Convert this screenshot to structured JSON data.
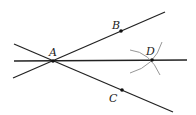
{
  "diagram": {
    "type": "geometric-construction",
    "points": [
      {
        "id": "A",
        "label": "A",
        "x": 53,
        "y": 61,
        "label_x": 49,
        "label_y": 56
      },
      {
        "id": "B",
        "label": "B",
        "x": 121,
        "y": 31,
        "label_x": 112,
        "label_y": 29
      },
      {
        "id": "C",
        "label": "C",
        "x": 122,
        "y": 90,
        "label_x": 109,
        "label_y": 102
      },
      {
        "id": "D",
        "label": "D",
        "x": 152,
        "y": 60,
        "label_x": 146,
        "label_y": 55
      }
    ],
    "lines": [
      {
        "name": "line-AB",
        "x1": 13,
        "y1": 78,
        "x2": 165,
        "y2": 12
      },
      {
        "name": "line-AC",
        "x1": 14,
        "y1": 44,
        "x2": 173,
        "y2": 112
      },
      {
        "name": "line-AD",
        "x1": 14,
        "y1": 61,
        "x2": 187,
        "y2": 60
      }
    ],
    "arcs": [
      {
        "name": "arc-from-B",
        "d": "M 130 50 Q 150 52 160 75"
      },
      {
        "name": "arc-from-C",
        "d": "M 162 42 Q 155 66 130 73"
      }
    ],
    "colors": {
      "line": "#222222",
      "arc": "#8a8a8a",
      "point": "#111111"
    }
  }
}
